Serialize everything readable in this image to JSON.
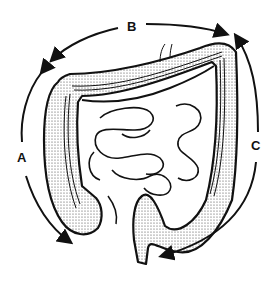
{
  "diagram": {
    "labels": {
      "a": "A",
      "b": "B",
      "c": "C"
    },
    "arrows": [
      {
        "label": "A",
        "direction": "downward along left side (ascending colon region)"
      },
      {
        "label": "B",
        "direction": "left to right across top (transverse colon region)"
      },
      {
        "label": "C",
        "direction": "downward along right side toward rectum (descending colon region)"
      }
    ],
    "colors": {
      "line": "#111111",
      "background": "#ffffff",
      "stipple": "#555555"
    }
  }
}
